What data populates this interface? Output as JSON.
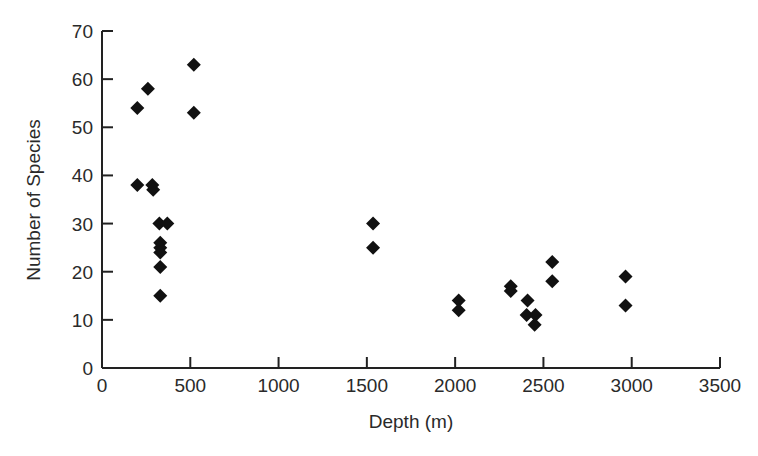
{
  "chart_data": {
    "type": "scatter",
    "title": "",
    "xlabel": "Depth (m)",
    "ylabel": "Number of Species",
    "xlim": [
      0,
      3500
    ],
    "ylim": [
      0,
      70
    ],
    "xticks": [
      0,
      500,
      1000,
      1500,
      2000,
      2500,
      3000,
      3500
    ],
    "yticks": [
      0,
      10,
      20,
      30,
      40,
      50,
      60,
      70
    ],
    "grid": false,
    "legend": null,
    "marker": "diamond",
    "marker_color": "#111111",
    "series": [
      {
        "name": "Species vs Depth",
        "points": [
          {
            "x": 200,
            "y": 54
          },
          {
            "x": 260,
            "y": 58
          },
          {
            "x": 520,
            "y": 63
          },
          {
            "x": 520,
            "y": 53
          },
          {
            "x": 200,
            "y": 38
          },
          {
            "x": 285,
            "y": 38
          },
          {
            "x": 290,
            "y": 37
          },
          {
            "x": 325,
            "y": 30
          },
          {
            "x": 370,
            "y": 30
          },
          {
            "x": 330,
            "y": 26
          },
          {
            "x": 330,
            "y": 25
          },
          {
            "x": 330,
            "y": 24
          },
          {
            "x": 330,
            "y": 21
          },
          {
            "x": 330,
            "y": 15
          },
          {
            "x": 1535,
            "y": 30
          },
          {
            "x": 1535,
            "y": 25
          },
          {
            "x": 2020,
            "y": 14
          },
          {
            "x": 2020,
            "y": 12
          },
          {
            "x": 2315,
            "y": 17
          },
          {
            "x": 2315,
            "y": 16
          },
          {
            "x": 2410,
            "y": 14
          },
          {
            "x": 2405,
            "y": 11
          },
          {
            "x": 2455,
            "y": 11
          },
          {
            "x": 2450,
            "y": 9
          },
          {
            "x": 2550,
            "y": 22
          },
          {
            "x": 2550,
            "y": 18
          },
          {
            "x": 2965,
            "y": 19
          },
          {
            "x": 2965,
            "y": 13
          }
        ]
      }
    ]
  }
}
